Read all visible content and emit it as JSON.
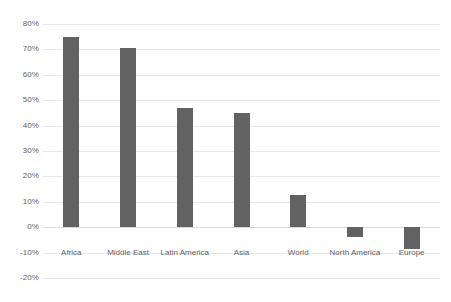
{
  "chart_data": {
    "type": "bar",
    "title": "",
    "subtitle": "",
    "xlabel": "",
    "ylabel": "",
    "categories": [
      "Africa",
      "Middle East",
      "Latin America",
      "Asia",
      "World",
      "North America",
      "Europe"
    ],
    "values": [
      75,
      70.5,
      47,
      45,
      12.5,
      -4,
      -8.5
    ],
    "value_labels": [
      "75%",
      "70.5%",
      "47%",
      "45%",
      "12.5%",
      "-4%",
      "-8.5%"
    ],
    "ylim": [
      -20,
      80
    ],
    "ytick_values": [
      80,
      70,
      60,
      50,
      40,
      30,
      20,
      10,
      0,
      -10,
      -20
    ],
    "ytick_labels": [
      "80%",
      "70%",
      "60%",
      "50%",
      "40%",
      "30%",
      "20%",
      "10%",
      "0%",
      "-10%",
      "-20%"
    ],
    "grid": true,
    "legend": false,
    "legend_position": "none",
    "series": [
      {
        "name": "",
        "values": [
          75,
          70.5,
          47,
          45,
          12.5,
          -4,
          -8.5
        ]
      }
    ],
    "colors": {
      "bar": "#626262",
      "gridline": "#e8e8e8",
      "baseline": "#d9d9d9",
      "tick_label": "#5f5f5f",
      "background": "#ffffff"
    }
  }
}
